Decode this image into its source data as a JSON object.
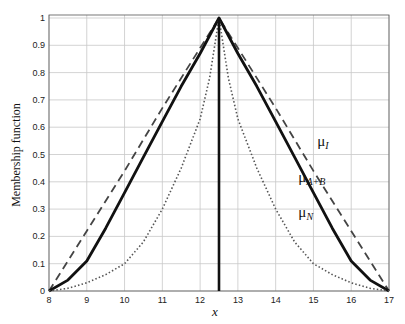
{
  "chart_data": {
    "type": "line",
    "title": "",
    "xlabel": "x",
    "ylabel": "Membership function",
    "xlim": [
      8,
      17
    ],
    "ylim": [
      0,
      1
    ],
    "grid": true,
    "xticks": [
      8,
      9,
      10,
      11,
      12,
      13,
      14,
      15,
      16,
      17
    ],
    "yticks": [
      0,
      0.1,
      0.2,
      0.3,
      0.4,
      0.5,
      0.6,
      0.7,
      0.8,
      0.9,
      1
    ],
    "ytick_labels": [
      "0",
      "0.1",
      "0.2",
      "0.3",
      "0.4",
      "0.5",
      "0.6",
      "0.7",
      "0.8",
      "0.9",
      "1"
    ],
    "series": [
      {
        "name": "μ_I",
        "style": "dashed",
        "x": [
          8,
          9,
          10,
          11,
          12,
          12.5,
          13,
          14,
          15,
          16,
          17
        ],
        "y": [
          0,
          0.22,
          0.44,
          0.67,
          0.89,
          1.0,
          0.89,
          0.67,
          0.44,
          0.22,
          0
        ]
      },
      {
        "name": "μ_A+B",
        "style": "solid",
        "x": [
          8,
          8.5,
          9,
          9.5,
          10,
          10.5,
          11,
          11.5,
          12,
          12.5,
          13,
          13.5,
          14,
          14.5,
          15,
          15.5,
          16,
          16.5,
          17
        ],
        "y": [
          0,
          0.04,
          0.11,
          0.23,
          0.36,
          0.49,
          0.62,
          0.75,
          0.87,
          1.0,
          0.87,
          0.75,
          0.62,
          0.49,
          0.36,
          0.23,
          0.11,
          0.04,
          0
        ]
      },
      {
        "name": "μ_N",
        "style": "dotted",
        "x": [
          8,
          8.5,
          9,
          9.5,
          10,
          10.5,
          11,
          11.5,
          12,
          12.25,
          12.5,
          12.75,
          13,
          13.5,
          14,
          14.5,
          15,
          15.5,
          16,
          16.5,
          17
        ],
        "y": [
          0,
          0.01,
          0.03,
          0.06,
          0.1,
          0.18,
          0.3,
          0.45,
          0.63,
          0.78,
          1.0,
          0.78,
          0.63,
          0.45,
          0.3,
          0.18,
          0.1,
          0.06,
          0.03,
          0.01,
          0
        ]
      }
    ],
    "vertical_line": {
      "x": 12.5,
      "style": "solid"
    },
    "annotations": [
      {
        "text": "μ",
        "sub": "I",
        "x": 15.1,
        "y": 0.53
      },
      {
        "text": "μ",
        "sub": "A+B",
        "x": 14.6,
        "y": 0.4
      },
      {
        "text": "μ",
        "sub": "N",
        "x": 14.6,
        "y": 0.27
      }
    ]
  }
}
